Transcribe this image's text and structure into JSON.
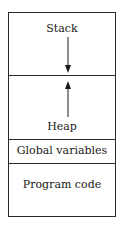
{
  "diagram": {
    "segments": [
      {
        "id": "stack",
        "label": "Stack",
        "growth": "down"
      },
      {
        "id": "heap",
        "label": "Heap",
        "growth": "up"
      },
      {
        "id": "globals",
        "label": "Global variables"
      },
      {
        "id": "code",
        "label": "Program code"
      }
    ],
    "colors": {
      "line": "#2a2a2a",
      "text": "#1a1a1a",
      "background": "#ffffff"
    }
  }
}
